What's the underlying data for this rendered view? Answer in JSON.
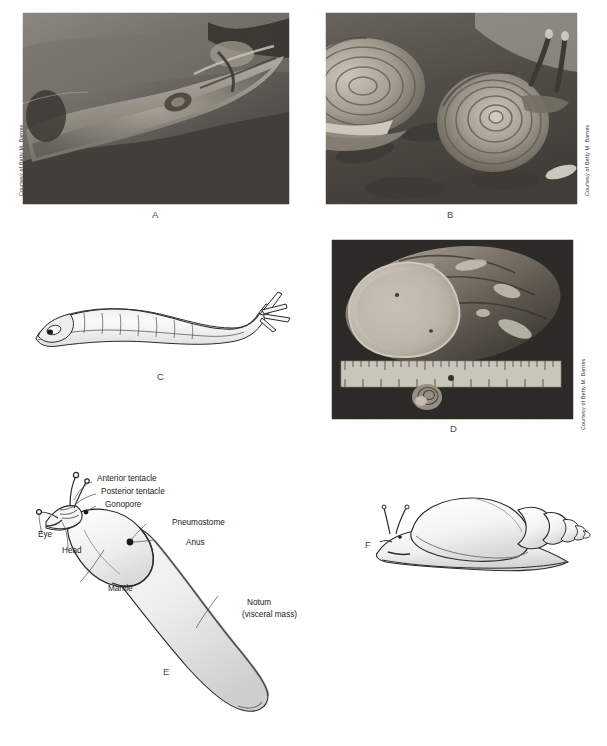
{
  "figure": {
    "type": "scientific-figure-plate",
    "panel_count": 6
  },
  "panels": [
    {
      "id": "A",
      "letter": "A",
      "kind": "photograph",
      "content": "Terrestrial slug crawling on rock",
      "credit": "Courtesy of Betty M. Barnes",
      "credit_side": "left"
    },
    {
      "id": "B",
      "letter": "B",
      "kind": "photograph",
      "content": "Land snails on leaf litter with extended tentacles",
      "credit": "Courtesy of Betty M. Barnes",
      "credit_side": "right"
    },
    {
      "id": "C",
      "letter": "C",
      "kind": "line-drawing",
      "content": "Lateral view of an elongate shell-less pulmonate"
    },
    {
      "id": "D",
      "letter": "D",
      "kind": "photograph",
      "content": "Large land snail shell beside a ruler with a small shell for scale",
      "credit": "Courtesy of Betty M. Barnes",
      "credit_side": "right"
    },
    {
      "id": "E",
      "letter": "E",
      "kind": "labeled-diagram",
      "content": "Dorsolateral view of a slug with external anatomy labeled"
    },
    {
      "id": "F",
      "letter": "F",
      "kind": "line-drawing",
      "content": "Land snail with elongate conical spired shell"
    }
  ],
  "labels_panel_e": [
    {
      "key": "anterior_tentacle",
      "text": "Anterior tentacle"
    },
    {
      "key": "posterior_tentacle",
      "text": "Posterior tentacle"
    },
    {
      "key": "gonopore",
      "text": "Gonopore"
    },
    {
      "key": "eye",
      "text": "Eye"
    },
    {
      "key": "head",
      "text": "Head"
    },
    {
      "key": "pneumostome",
      "text": "Pneumostome"
    },
    {
      "key": "anus",
      "text": "Anus"
    },
    {
      "key": "mantle",
      "text": "Mantle"
    },
    {
      "key": "notum_line1",
      "text": "Notum"
    },
    {
      "key": "notum_line2",
      "text": "(visceral mass)"
    }
  ],
  "colors": {
    "page_background": "#ffffff",
    "ink": "#1a1a1a",
    "letter_gray": "#4a4a4a",
    "credit_gray": "#3a3a3a",
    "photo_dark": "#2b2b2b"
  }
}
